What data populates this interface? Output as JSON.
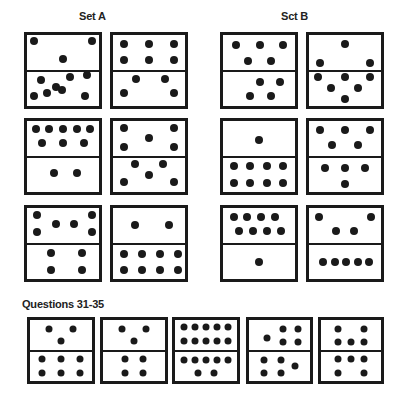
{
  "titles": {
    "set_a": "Set A",
    "set_b": "Sct B",
    "questions": "Questions 31-35"
  },
  "colors": {
    "ink": "#1a1a1a",
    "background": "#ffffff"
  },
  "dominoes": [
    {
      "group": "set_a",
      "box": [
        24,
        32,
        78,
        77
      ],
      "top": [
        [
          10,
          17
        ],
        [
          90,
          17
        ],
        [
          50,
          70
        ]
      ],
      "bottom": [
        [
          20,
          25
        ],
        [
          60,
          16
        ],
        [
          84,
          10
        ],
        [
          40,
          45
        ],
        [
          10,
          70
        ],
        [
          28,
          62
        ],
        [
          49,
          55
        ],
        [
          80,
          72
        ]
      ]
    },
    {
      "group": "set_a",
      "box": [
        110,
        32,
        78,
        77
      ],
      "top": [
        [
          15,
          25
        ],
        [
          50,
          25
        ],
        [
          85,
          25
        ],
        [
          15,
          72
        ],
        [
          50,
          72
        ],
        [
          85,
          72
        ]
      ],
      "bottom": [
        [
          32,
          22
        ],
        [
          72,
          22
        ],
        [
          15,
          62
        ],
        [
          85,
          62
        ]
      ]
    },
    {
      "group": "set_a",
      "box": [
        24,
        118,
        78,
        77
      ],
      "top": [
        [
          12,
          22
        ],
        [
          31,
          22
        ],
        [
          50,
          22
        ],
        [
          69,
          22
        ],
        [
          88,
          22
        ],
        [
          21,
          65
        ],
        [
          50,
          65
        ],
        [
          79,
          65
        ]
      ],
      "bottom": [
        [
          38,
          45
        ],
        [
          70,
          45
        ]
      ]
    },
    {
      "group": "set_a",
      "box": [
        110,
        118,
        78,
        77
      ],
      "top": [
        [
          15,
          20
        ],
        [
          50,
          48
        ],
        [
          85,
          20
        ],
        [
          15,
          75
        ],
        [
          85,
          75
        ]
      ],
      "bottom": [
        [
          30,
          20
        ],
        [
          70,
          20
        ],
        [
          50,
          50
        ],
        [
          15,
          72
        ],
        [
          85,
          72
        ]
      ]
    },
    {
      "group": "set_a",
      "box": [
        24,
        205,
        78,
        77
      ],
      "top": [
        [
          14,
          20
        ],
        [
          40,
          45
        ],
        [
          65,
          45
        ],
        [
          90,
          20
        ],
        [
          14,
          70
        ],
        [
          90,
          70
        ]
      ],
      "bottom": [
        [
          34,
          25
        ],
        [
          76,
          25
        ],
        [
          34,
          75
        ],
        [
          76,
          75
        ]
      ]
    },
    {
      "group": "set_a",
      "box": [
        110,
        205,
        78,
        77
      ],
      "top": [
        [
          30,
          50
        ],
        [
          78,
          50
        ]
      ],
      "bottom": [
        [
          15,
          27
        ],
        [
          40,
          27
        ],
        [
          65,
          27
        ],
        [
          90,
          27
        ],
        [
          15,
          75
        ],
        [
          40,
          75
        ],
        [
          65,
          75
        ],
        [
          90,
          75
        ]
      ]
    },
    {
      "group": "set_b",
      "box": [
        220,
        32,
        78,
        77
      ],
      "top": [
        [
          18,
          30
        ],
        [
          51,
          30
        ],
        [
          84,
          30
        ],
        [
          35,
          75
        ],
        [
          67,
          75
        ]
      ],
      "bottom": [
        [
          51,
          30
        ],
        [
          79,
          30
        ],
        [
          37,
          72
        ],
        [
          67,
          72
        ]
      ]
    },
    {
      "group": "set_b",
      "box": [
        306,
        32,
        78,
        77
      ],
      "top": [
        [
          50,
          25
        ],
        [
          15,
          80
        ],
        [
          85,
          80
        ]
      ],
      "bottom": [
        [
          12,
          15
        ],
        [
          50,
          15
        ],
        [
          85,
          15
        ],
        [
          30,
          48
        ],
        [
          68,
          48
        ],
        [
          50,
          80
        ]
      ]
    },
    {
      "group": "set_b",
      "box": [
        220,
        118,
        78,
        77
      ],
      "top": [
        [
          50,
          55
        ]
      ],
      "bottom": [
        [
          15,
          25
        ],
        [
          38,
          25
        ],
        [
          61,
          25
        ],
        [
          84,
          25
        ],
        [
          15,
          75
        ],
        [
          38,
          75
        ],
        [
          61,
          75
        ],
        [
          84,
          75
        ]
      ]
    },
    {
      "group": "set_b",
      "box": [
        306,
        118,
        78,
        77
      ],
      "top": [
        [
          15,
          25
        ],
        [
          50,
          25
        ],
        [
          85,
          25
        ],
        [
          32,
          70
        ],
        [
          68,
          70
        ]
      ],
      "bottom": [
        [
          22,
          30
        ],
        [
          50,
          30
        ],
        [
          78,
          30
        ],
        [
          50,
          78
        ]
      ]
    },
    {
      "group": "set_b",
      "box": [
        220,
        205,
        78,
        77
      ],
      "top": [
        [
          15,
          25
        ],
        [
          34,
          25
        ],
        [
          53,
          25
        ],
        [
          72,
          25
        ],
        [
          22,
          68
        ],
        [
          42,
          68
        ],
        [
          61,
          68
        ],
        [
          80,
          68
        ]
      ],
      "bottom": [
        [
          50,
          50
        ]
      ]
    },
    {
      "group": "set_b",
      "box": [
        306,
        205,
        78,
        77
      ],
      "top": [
        [
          14,
          25
        ],
        [
          86,
          25
        ],
        [
          38,
          68
        ],
        [
          62,
          68
        ]
      ],
      "bottom": [
        [
          20,
          50
        ],
        [
          36,
          50
        ],
        [
          52,
          50
        ],
        [
          68,
          50
        ],
        [
          84,
          50
        ]
      ]
    },
    {
      "group": "questions",
      "label": "31",
      "box": [
        27,
        317,
        68,
        67
      ],
      "top": [
        [
          30,
          30
        ],
        [
          70,
          30
        ],
        [
          50,
          70
        ]
      ],
      "bottom": [
        [
          20,
          25
        ],
        [
          50,
          25
        ],
        [
          80,
          25
        ],
        [
          20,
          72
        ],
        [
          50,
          72
        ],
        [
          80,
          72
        ]
      ]
    },
    {
      "group": "questions",
      "label": "32",
      "box": [
        100,
        317,
        68,
        67
      ],
      "top": [
        [
          30,
          30
        ],
        [
          70,
          30
        ],
        [
          50,
          70
        ]
      ],
      "bottom": [
        [
          35,
          25
        ],
        [
          65,
          25
        ],
        [
          35,
          72
        ],
        [
          65,
          72
        ]
      ]
    },
    {
      "group": "questions",
      "label": "33",
      "box": [
        172,
        317,
        68,
        67
      ],
      "top": [
        [
          15,
          25
        ],
        [
          32,
          25
        ],
        [
          50,
          25
        ],
        [
          68,
          25
        ],
        [
          85,
          25
        ],
        [
          15,
          70
        ],
        [
          32,
          70
        ],
        [
          50,
          70
        ],
        [
          68,
          70
        ],
        [
          85,
          70
        ]
      ],
      "bottom": [
        [
          15,
          28
        ],
        [
          32,
          28
        ],
        [
          50,
          28
        ],
        [
          68,
          28
        ],
        [
          85,
          28
        ],
        [
          37,
          72
        ],
        [
          63,
          72
        ]
      ]
    },
    {
      "group": "questions",
      "label": "34",
      "box": [
        246,
        317,
        67,
        67
      ],
      "top": [
        [
          30,
          60
        ],
        [
          55,
          30
        ],
        [
          80,
          30
        ],
        [
          55,
          75
        ],
        [
          80,
          75
        ]
      ],
      "bottom": [
        [
          25,
          28
        ],
        [
          52,
          28
        ],
        [
          75,
          48
        ],
        [
          25,
          72
        ],
        [
          52,
          72
        ]
      ]
    },
    {
      "group": "questions",
      "label": "35",
      "box": [
        318,
        317,
        66,
        67
      ],
      "top": [
        [
          28,
          30
        ],
        [
          72,
          30
        ],
        [
          28,
          75
        ],
        [
          50,
          75
        ],
        [
          72,
          75
        ]
      ],
      "bottom": [
        [
          28,
          25
        ],
        [
          50,
          25
        ],
        [
          72,
          25
        ],
        [
          28,
          72
        ],
        [
          72,
          72
        ]
      ]
    }
  ]
}
